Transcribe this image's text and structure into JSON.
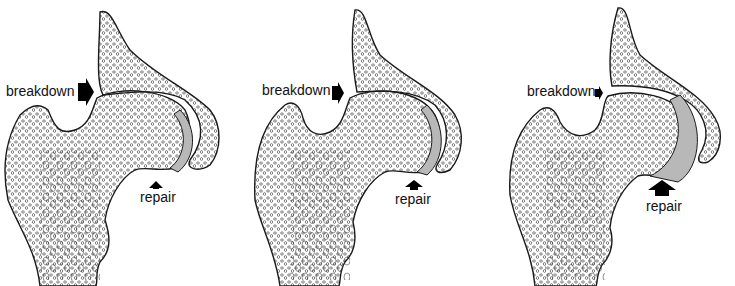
{
  "figure": {
    "colors": {
      "background": "#ffffff",
      "line": "#1a1a1a",
      "arrow": "#000000",
      "cartilage": "#b8b8b8"
    },
    "panels": [
      {
        "breakdown_label": "breakdown",
        "repair_label": "repair",
        "breakdown_arrow_size": "large",
        "repair_arrow_size": "small"
      },
      {
        "breakdown_label": "breakdown",
        "repair_label": "repair",
        "breakdown_arrow_size": "medium",
        "repair_arrow_size": "medium"
      },
      {
        "breakdown_label": "breakdown",
        "repair_label": "repair",
        "breakdown_arrow_size": "small",
        "repair_arrow_size": "large"
      }
    ]
  }
}
